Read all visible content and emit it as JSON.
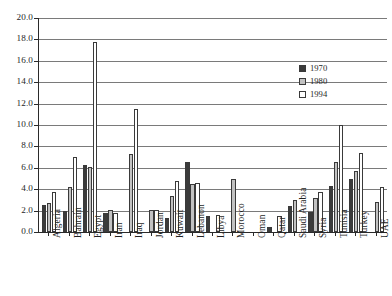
{
  "chart_data": {
    "type": "bar",
    "title": "",
    "subtitle": "",
    "xlabel": "",
    "ylabel": "",
    "ylim": [
      0.0,
      20.0
    ],
    "ytick_step": 2.0,
    "ytick_labels": [
      "0.0",
      "2.0",
      "4.0",
      "6.0",
      "8.0",
      "10.0",
      "12.0",
      "14.0",
      "16.0",
      "18.0",
      "20.0"
    ],
    "ytick_values": [
      0.0,
      2.0,
      4.0,
      6.0,
      8.0,
      10.0,
      12.0,
      14.0,
      16.0,
      18.0,
      20.0
    ],
    "grid": true,
    "grid_axis": "y",
    "legend_position": "right-upper",
    "categories": [
      "Algeria",
      "Bahrain",
      "Egypt",
      "Iran",
      "Iraq",
      "Jordan",
      "Kuwait",
      "Lebanon",
      "Libya",
      "Morocco",
      "Oman",
      "Qatar",
      "Saudi Arabia",
      "Syria",
      "Tunisia",
      "Turkey",
      "UAE"
    ],
    "series": [
      {
        "name": "1970",
        "color": "#3b3b3b",
        "values": [
          2.5,
          2.0,
          6.3,
          1.8,
          null,
          null,
          1.3,
          6.5,
          1.5,
          null,
          null,
          0.5,
          2.4,
          1.9,
          4.3,
          5.0,
          null
        ]
      },
      {
        "name": "1980",
        "color": "#c2c2c2",
        "values": [
          2.7,
          4.2,
          6.1,
          2.1,
          7.3,
          2.1,
          3.4,
          4.5,
          null,
          5.0,
          null,
          null,
          3.0,
          3.2,
          6.5,
          5.7,
          2.8
        ]
      },
      {
        "name": "1994",
        "color": "#ffffff",
        "values": [
          3.7,
          7.0,
          5.8,
          1.8,
          11.5,
          2.1,
          4.8,
          4.6,
          1.6,
          null,
          null,
          1.5,
          null,
          3.7,
          10.0,
          7.4,
          4.2
        ]
      }
    ],
    "special_bars": [
      {
        "category": "Egypt",
        "series": "1994",
        "value": 17.8,
        "note": "tall outlier bar"
      }
    ]
  },
  "legend": {
    "entries": [
      {
        "label": "1970",
        "swatch": "dark-filled-square"
      },
      {
        "label": "1980",
        "swatch": "gray-filled-square"
      },
      {
        "label": "1994",
        "swatch": "white-open-square"
      }
    ]
  },
  "colors": {
    "series_1970": "#3b3b3b",
    "series_1980": "#c2c2c2",
    "series_1994": "#ffffff",
    "axis": "#2a2a2a",
    "gridline": "#7a7a7a",
    "background": "#ffffff",
    "text": "#1f1f1f"
  }
}
